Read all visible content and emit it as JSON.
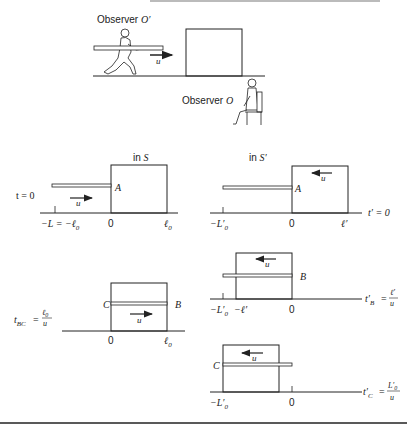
{
  "top_scene": {
    "observer_moving_label": "Observer ",
    "observer_moving_symbol": "O′",
    "observer_rest_label": "Observer ",
    "observer_rest_symbol": "O",
    "velocity_label": "u"
  },
  "panel_S_t0": {
    "frame_label_prefix": "in ",
    "frame_symbol": "S",
    "time_label": "t = 0",
    "point_A": "A",
    "velocity_label": "u",
    "tick_left": "−L = −ℓ",
    "tick_left_sub": "0",
    "tick_zero": "0",
    "tick_right": "ℓ",
    "tick_right_sub": "0"
  },
  "panel_Sprime_t0": {
    "frame_label_prefix": "in ",
    "frame_symbol": "S′",
    "time_label": "t′ = 0",
    "point_A": "A",
    "velocity_label": "u",
    "tick_left": "−L′",
    "tick_left_sub": "0",
    "tick_zero": "0",
    "tick_right": "ℓ′"
  },
  "panel_S_tBC": {
    "time_label_lhs": "t",
    "time_label_sub": "BC",
    "time_label_num": "ℓ",
    "time_label_num_sub": "0",
    "time_label_den": "u",
    "point_B": "B",
    "point_C": "C",
    "velocity_label": "u",
    "tick_zero": "0",
    "tick_right": "ℓ",
    "tick_right_sub": "0"
  },
  "panel_Sprime_tB": {
    "time_label_lhs": "t′",
    "time_label_sub": "B",
    "time_label_num": "ℓ′",
    "time_label_den": "u",
    "point_B": "B",
    "velocity_label": "u",
    "tick_left": "−L′",
    "tick_left_sub": "0",
    "tick_mid": "−ℓ′",
    "tick_zero": "0"
  },
  "panel_Sprime_tC": {
    "time_label_lhs": "t′",
    "time_label_sub": "C",
    "time_label_num": "L′",
    "time_label_num_sub": "0",
    "time_label_den": "u",
    "point_C": "C",
    "velocity_label": "u",
    "tick_left": "−L′",
    "tick_left_sub": "0",
    "tick_zero": "0"
  }
}
